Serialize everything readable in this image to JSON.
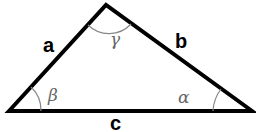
{
  "diagram": {
    "type": "triangle",
    "vertices": {
      "left": [
        9,
        111
      ],
      "top": [
        106,
        5
      ],
      "right": [
        252,
        111
      ]
    },
    "sides": {
      "a": "a",
      "b": "b",
      "c": "c"
    },
    "angles": {
      "alpha": "α",
      "beta": "β",
      "gamma": "γ"
    },
    "colors": {
      "stroke": "#000000",
      "arc": "#888888",
      "angle_text": "#666666"
    }
  }
}
